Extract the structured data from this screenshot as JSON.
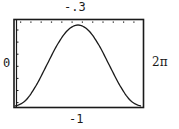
{
  "window": {
    "ymax_label": "-.3",
    "ymin_label": "-1",
    "xmin_label": "0",
    "xmax_label": "2π"
  },
  "colors": {
    "background": "#ffffff",
    "frame": "#1a1a1a",
    "curve": "#1a1a1a"
  },
  "chart_data": {
    "type": "line",
    "title": "",
    "xlabel": "",
    "ylabel": "",
    "xlim": [
      0,
      6.2832
    ],
    "ylim": [
      -1,
      -0.3
    ],
    "x_range_labels": [
      "0",
      "2π"
    ],
    "y_range_labels": [
      "-1",
      "-.3"
    ],
    "grid": false,
    "legend": null,
    "ticks": {
      "top_dots": 12,
      "left_ticks": 7
    },
    "series": [
      {
        "name": "curve",
        "x": [
          0,
          0.5236,
          1.0472,
          1.5708,
          2.0944,
          2.618,
          3.1416,
          3.6652,
          4.1888,
          4.7124,
          5.236,
          5.7596,
          6.2832
        ],
        "values": [
          -1.0,
          -0.955,
          -0.833,
          -0.667,
          -0.5,
          -0.378,
          -0.333,
          -0.378,
          -0.5,
          -0.667,
          -0.833,
          -0.955,
          -1.0
        ]
      }
    ]
  }
}
